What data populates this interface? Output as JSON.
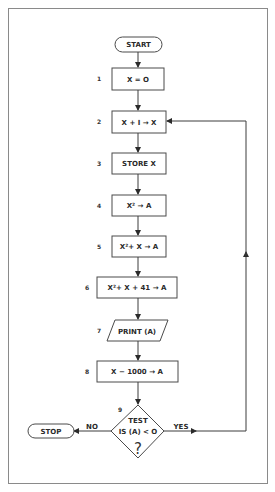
{
  "diagram": {
    "type": "flowchart",
    "start": {
      "label": "START"
    },
    "stop": {
      "label": "STOP"
    },
    "steps": [
      {
        "num": "1",
        "text": "X = O",
        "shape": "process"
      },
      {
        "num": "2",
        "text": "X + I → X",
        "shape": "process"
      },
      {
        "num": "3",
        "text": "STORE X",
        "shape": "process"
      },
      {
        "num": "4",
        "text": "X² → A",
        "shape": "process"
      },
      {
        "num": "5",
        "text": "X²+ X → A",
        "shape": "process"
      },
      {
        "num": "6",
        "text": "X²+ X + 41 → A",
        "shape": "process"
      },
      {
        "num": "7",
        "text": "PRINT (A)",
        "shape": "io"
      },
      {
        "num": "8",
        "text": "X − 1000 → A",
        "shape": "process"
      }
    ],
    "decision": {
      "num": "9",
      "line1": "TEST",
      "line2": "IS (A) < O",
      "line3": "?",
      "no_label": "NO",
      "yes_label": "YES"
    },
    "edges": [
      {
        "from": "START",
        "to": "1"
      },
      {
        "from": "1",
        "to": "2"
      },
      {
        "from": "2",
        "to": "3"
      },
      {
        "from": "3",
        "to": "4"
      },
      {
        "from": "4",
        "to": "5"
      },
      {
        "from": "5",
        "to": "6"
      },
      {
        "from": "6",
        "to": "7"
      },
      {
        "from": "7",
        "to": "8"
      },
      {
        "from": "8",
        "to": "9"
      },
      {
        "from": "9",
        "to": "STOP",
        "label": "NO"
      },
      {
        "from": "9",
        "to": "2",
        "label": "YES"
      }
    ]
  }
}
